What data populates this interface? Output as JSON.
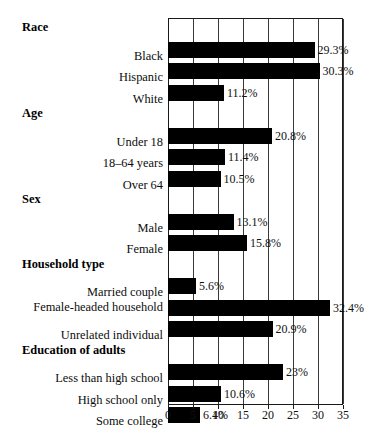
{
  "chart_data": {
    "type": "bar",
    "orientation": "horizontal",
    "title": "",
    "xlabel": "",
    "ylabel": "",
    "xlim": [
      0,
      35
    ],
    "xticks": [
      0,
      5,
      10,
      15,
      20,
      25,
      30,
      35
    ],
    "grid": true,
    "legend": false,
    "value_suffix": "%",
    "bar_color": "#000000",
    "frame_color": "#1a1a1a",
    "groups": [
      {
        "header": "Race",
        "rows": [
          {
            "label": "Black",
            "value": 29.3,
            "value_label": "29.3%"
          },
          {
            "label": "Hispanic",
            "value": 30.3,
            "value_label": "30.3%"
          },
          {
            "label": "White",
            "value": 11.2,
            "value_label": "11.2%"
          }
        ]
      },
      {
        "header": "Age",
        "rows": [
          {
            "label": "Under 18",
            "value": 20.8,
            "value_label": "20.8%"
          },
          {
            "label": "18–64 years",
            "value": 11.4,
            "value_label": "11.4%"
          },
          {
            "label": "Over 64",
            "value": 10.5,
            "value_label": "10.5%"
          }
        ]
      },
      {
        "header": "Sex",
        "rows": [
          {
            "label": "Male",
            "value": 13.1,
            "value_label": "13.1%"
          },
          {
            "label": "Female",
            "value": 15.8,
            "value_label": "15.8%"
          }
        ]
      },
      {
        "header": "Household type",
        "rows": [
          {
            "label": "Married couple",
            "value": 5.6,
            "value_label": "5.6%"
          },
          {
            "label": "Female-headed household",
            "value": 32.4,
            "value_label": "32.4%"
          },
          {
            "label": "Unrelated individual",
            "value": 20.9,
            "value_label": "20.9%"
          }
        ]
      },
      {
        "header": "Education of adults",
        "rows": [
          {
            "label": "Less than high school",
            "value": 23.0,
            "value_label": "23%"
          },
          {
            "label": "High school only",
            "value": 10.6,
            "value_label": "10.6%"
          },
          {
            "label": "Some college",
            "value": 6.4,
            "value_label": "6.4%"
          }
        ]
      }
    ]
  },
  "axis": {
    "tick_labels": [
      "0",
      "5",
      "10",
      "15",
      "20",
      "25",
      "30",
      "35"
    ]
  }
}
